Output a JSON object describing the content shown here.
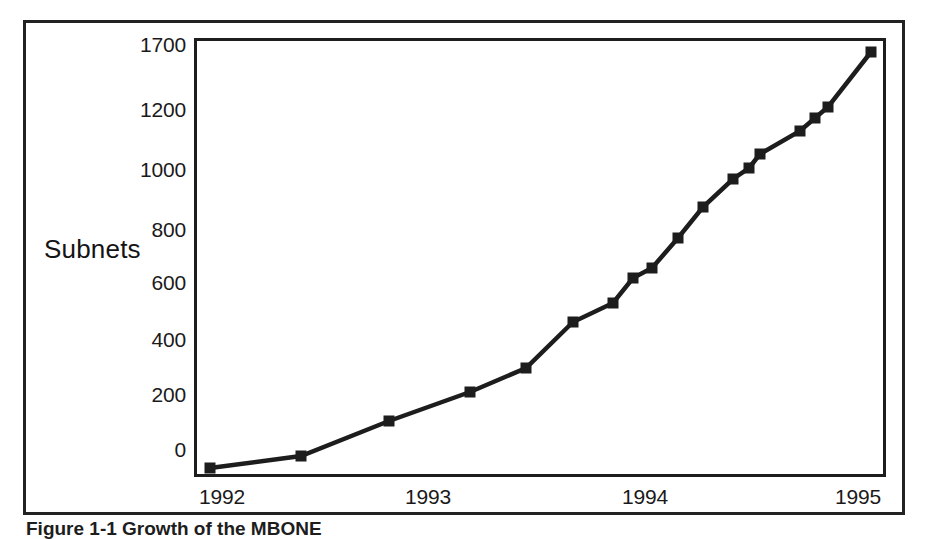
{
  "figure": {
    "caption": "Figure 1-1  Growth of the MBONE",
    "frame_color": "#222222",
    "line_color": "#1d1d1d",
    "background": "#ffffff"
  },
  "axis_title": "Subnets",
  "chart_data": {
    "type": "line",
    "title": "",
    "subtitle": "",
    "xlabel": "",
    "ylabel": "Subnets",
    "grid": false,
    "legend": "none",
    "marker": "square",
    "marker_color": "#1d1d1d",
    "line_color": "#1d1d1d",
    "x_tick_labels": [
      "1992",
      "1993",
      "1994",
      "1995"
    ],
    "x_tick_values": [
      1992,
      1993,
      1994,
      1995
    ],
    "y_tick_labels": [
      "0",
      "200",
      "400",
      "600",
      "800",
      "1000",
      "1200",
      "1700"
    ],
    "y_tick_values": [
      0,
      200,
      400,
      600,
      800,
      1000,
      1200,
      1700
    ],
    "xlim": [
      1992,
      1995.1
    ],
    "ylim": [
      0,
      1700
    ],
    "note": "y-axis is non-uniform: the gap between 1200 and 1700 is compressed",
    "x": [
      1992.0,
      1992.42,
      1992.84,
      1993.21,
      1993.47,
      1993.69,
      1993.87,
      1993.96,
      1994.05,
      1994.17,
      1994.29,
      1994.43,
      1994.5,
      1994.55,
      1994.74,
      1994.81,
      1994.87,
      1995.07
    ],
    "values": [
      10,
      50,
      170,
      255,
      340,
      495,
      560,
      640,
      670,
      770,
      880,
      965,
      1000,
      1050,
      1130,
      1175,
      1220,
      1680
    ],
    "series": [
      {
        "name": "Subnets",
        "points": [
          {
            "x": 1992.0,
            "y": 10
          },
          {
            "x": 1992.42,
            "y": 50
          },
          {
            "x": 1992.84,
            "y": 170
          },
          {
            "x": 1993.21,
            "y": 255
          },
          {
            "x": 1993.47,
            "y": 340
          },
          {
            "x": 1993.69,
            "y": 495
          },
          {
            "x": 1993.87,
            "y": 560
          },
          {
            "x": 1993.96,
            "y": 640
          },
          {
            "x": 1994.05,
            "y": 670
          },
          {
            "x": 1994.17,
            "y": 770
          },
          {
            "x": 1994.29,
            "y": 880
          },
          {
            "x": 1994.43,
            "y": 965
          },
          {
            "x": 1994.5,
            "y": 1000
          },
          {
            "x": 1994.55,
            "y": 1050
          },
          {
            "x": 1994.74,
            "y": 1130
          },
          {
            "x": 1994.81,
            "y": 1175
          },
          {
            "x": 1994.87,
            "y": 1220
          },
          {
            "x": 1995.07,
            "y": 1680
          }
        ]
      }
    ],
    "pixel_geometry": {
      "plot_left": 194,
      "plot_right": 886,
      "plot_top": 38,
      "plot_bottom": 477,
      "y_tick_px": [
        450,
        395,
        340,
        283,
        230,
        170,
        110,
        45
      ],
      "x_tick_px": [
        222,
        428,
        645,
        858
      ],
      "marker_px": [
        [
          210,
          468
        ],
        [
          301,
          456
        ],
        [
          389,
          421
        ],
        [
          470,
          392
        ],
        [
          526,
          368
        ],
        [
          573,
          322
        ],
        [
          613,
          303
        ],
        [
          633,
          278
        ],
        [
          652,
          268
        ],
        [
          678,
          238
        ],
        [
          703,
          207
        ],
        [
          733,
          179
        ],
        [
          749,
          168
        ],
        [
          760,
          154
        ],
        [
          800,
          131
        ],
        [
          815,
          118
        ],
        [
          828,
          107
        ],
        [
          871,
          52
        ]
      ]
    }
  }
}
